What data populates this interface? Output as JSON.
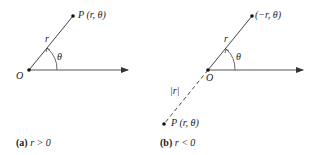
{
  "panels": [
    {
      "id": "a",
      "caption_tag": "(a)",
      "caption_cond": "r > 0",
      "origin_label": "O",
      "point_label": "P (r, θ)",
      "radius_label": "r",
      "angle_label": "θ"
    },
    {
      "id": "b",
      "caption_tag": "(b)",
      "caption_cond": "r < 0",
      "origin_label": "O",
      "point_label": "(−r, θ)",
      "radius_label": "r",
      "angle_label": "θ",
      "abs_radius_label": "|r|",
      "reflected_point_label": "P (r, θ)"
    }
  ],
  "colors": {
    "line": "#333333",
    "text": "#222222"
  }
}
